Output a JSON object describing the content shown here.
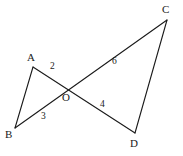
{
  "figure": {
    "background_color": "#ffffff",
    "stroke_color": "#1a1a1a",
    "text_color": "#1a1a1a",
    "stroke_width": 1.1,
    "vertices": [
      {
        "id": "A",
        "label": "A",
        "x": 33,
        "y": 67,
        "label_x": 27,
        "label_y": 52
      },
      {
        "id": "B",
        "label": "B",
        "x": 15,
        "y": 128,
        "label_x": 5,
        "label_y": 129
      },
      {
        "id": "C",
        "label": "C",
        "x": 167,
        "y": 20,
        "label_x": 162,
        "label_y": 4
      },
      {
        "id": "D",
        "label": "D",
        "x": 135,
        "y": 133,
        "label_x": 130,
        "label_y": 138
      },
      {
        "id": "O",
        "label": "O",
        "x": 68,
        "y": 88,
        "label_x": 62,
        "label_y": 92
      }
    ],
    "segments": [
      {
        "id": "AB",
        "from": "A",
        "to": "B"
      },
      {
        "id": "AD",
        "from": "A",
        "to": "D"
      },
      {
        "id": "BC",
        "from": "B",
        "to": "C"
      },
      {
        "id": "CD",
        "from": "C",
        "to": "D"
      }
    ],
    "angle_labels": [
      {
        "id": "angle-2",
        "text": "2",
        "x": 50,
        "y": 62
      },
      {
        "id": "angle-3",
        "text": "3",
        "x": 41,
        "y": 112
      },
      {
        "id": "angle-4",
        "text": "4",
        "x": 100,
        "y": 100
      },
      {
        "id": "angle-6",
        "text": "6",
        "x": 112,
        "y": 57
      }
    ]
  }
}
